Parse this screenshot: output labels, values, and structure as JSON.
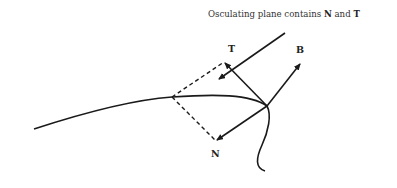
{
  "caption": {
    "prefix": "Osculating plane contains ",
    "n": "N",
    "mid": " and ",
    "t": "T"
  },
  "labels": {
    "tangent": "T",
    "binormal": "B",
    "normal": "N"
  },
  "colors": {
    "stroke": "#1a1a1a",
    "background": "#ffffff"
  },
  "geometry": {
    "origin": [
      267,
      106
    ],
    "tangent_tip": [
      224,
      62
    ],
    "normal_tip": [
      216,
      141
    ],
    "binormal_tip": [
      301,
      63
    ],
    "plane_corner": [
      172,
      97
    ],
    "pointer_line": {
      "from": [
        285,
        33
      ],
      "to": [
        217,
        80
      ]
    }
  }
}
